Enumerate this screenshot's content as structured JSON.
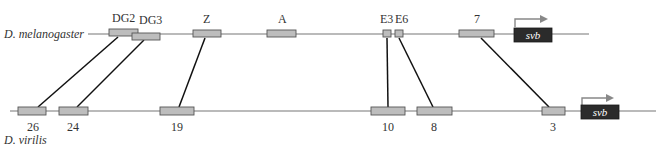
{
  "species": {
    "top": "D. melanogaster",
    "bottom": "D. virilis"
  },
  "gene": {
    "top_label": "svb",
    "bottom_label": "svb"
  },
  "top_enhancers": [
    {
      "label": "DG2"
    },
    {
      "label": "DG3"
    },
    {
      "label": "Z"
    },
    {
      "label": "A"
    },
    {
      "label": "E3"
    },
    {
      "label": "E6"
    },
    {
      "label": "7"
    }
  ],
  "bottom_enhancers": [
    {
      "label": "26"
    },
    {
      "label": "24"
    },
    {
      "label": "19"
    },
    {
      "label": "10"
    },
    {
      "label": "8"
    },
    {
      "label": "3"
    }
  ],
  "homology_links": [
    {
      "from": "DG2",
      "to": "26"
    },
    {
      "from": "DG3",
      "to": "24"
    },
    {
      "from": "Z",
      "to": "19"
    },
    {
      "from": "E3",
      "to": "10"
    },
    {
      "from": "E6",
      "to": "8"
    },
    {
      "from": "7",
      "to": "3"
    }
  ],
  "colors": {
    "enhancer_fill": "#bdbdbd",
    "gene_fill": "#2b2b2b",
    "link": "#111111",
    "backbone": "#777777"
  }
}
